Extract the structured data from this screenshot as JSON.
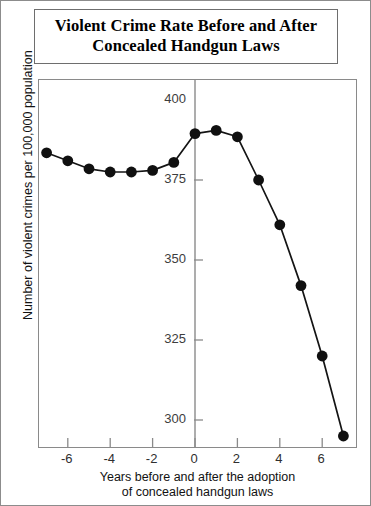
{
  "title": {
    "line1": "Violent Crime Rate Before and After",
    "line2": "Concealed Handgun Laws"
  },
  "axes": {
    "ylabel": "Number of violent crimes per 100,000 population",
    "xlabel_line1": "Years before and after the adoption",
    "xlabel_line2": "of concealed handgun laws",
    "ytick_labels": [
      "400",
      "375",
      "350",
      "325",
      "300"
    ],
    "xtick_labels": [
      "-6",
      "-4",
      "-2",
      "0",
      "2",
      "4",
      "6"
    ]
  },
  "colors": {
    "line": "#141414",
    "marker": "#101010",
    "axis": "#8a8a8a",
    "frame": "#8c8c8c",
    "tick_text": "#333333",
    "title_text": "#000000"
  },
  "chart_data": {
    "type": "line",
    "title": "Violent Crime Rate Before and After Concealed Handgun Laws",
    "xlabel": "Years before and after the adoption of concealed handgun laws",
    "ylabel": "Number of violent crimes per 100,000 population",
    "x": [
      -7,
      -6,
      -5,
      -4,
      -3,
      -2,
      -1,
      0,
      1,
      2,
      3,
      4,
      5,
      6,
      7
    ],
    "values": [
      383.5,
      381.0,
      378.5,
      377.5,
      377.5,
      378.0,
      380.5,
      389.5,
      390.5,
      388.5,
      375.0,
      361.0,
      342.0,
      320.0,
      295.0
    ],
    "xlim": [
      -7.8,
      7.8
    ],
    "ylim": [
      288,
      403
    ],
    "xticks": [
      -6,
      -4,
      -2,
      0,
      2,
      4,
      6
    ],
    "yticks": [
      400,
      375,
      350,
      325,
      300
    ],
    "grid": false,
    "legend": null,
    "marker": "filled-circle",
    "series": [
      {
        "name": "Violent crime rate",
        "values": [
          383.5,
          381.0,
          378.5,
          377.5,
          377.5,
          378.0,
          380.5,
          389.5,
          390.5,
          388.5,
          375.0,
          361.0,
          342.0,
          320.0,
          295.0
        ]
      }
    ]
  }
}
